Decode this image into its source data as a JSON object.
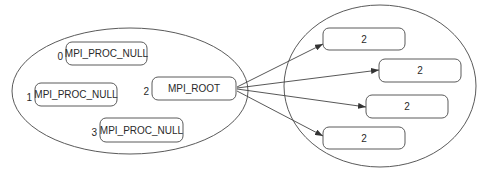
{
  "diagram": {
    "type": "mpi-intercommunicator-broadcast",
    "left_group": {
      "name": "root-group",
      "ellipse": {
        "cx": 130,
        "cy": 91,
        "rx": 118,
        "ry": 63
      },
      "processes": [
        {
          "rank": "0",
          "label": "MPI_PROC_NULL",
          "x": 66,
          "y": 42,
          "w": 81,
          "h": 23
        },
        {
          "rank": "1",
          "label": "MPI_PROC_NULL",
          "x": 35,
          "y": 83,
          "w": 82,
          "h": 23
        },
        {
          "rank": "2",
          "label": "MPI_ROOT",
          "x": 152,
          "y": 77,
          "w": 84,
          "h": 23
        },
        {
          "rank": "3",
          "label": "MPI_PROC_NULL",
          "x": 100,
          "y": 118,
          "w": 83,
          "h": 24
        }
      ]
    },
    "right_group": {
      "name": "receiver-group",
      "ellipse": {
        "cx": 380,
        "cy": 86,
        "rx": 96,
        "ry": 81
      },
      "processes": [
        {
          "label": "2",
          "x": 323,
          "y": 28,
          "w": 82,
          "h": 22
        },
        {
          "label": "2",
          "x": 379,
          "y": 59,
          "w": 82,
          "h": 23
        },
        {
          "label": "2",
          "x": 366,
          "y": 95,
          "w": 82,
          "h": 23
        },
        {
          "label": "2",
          "x": 323,
          "y": 127,
          "w": 82,
          "h": 22
        }
      ]
    },
    "arrows": [
      {
        "from": [
          237,
          87
        ],
        "to": [
          323,
          44
        ]
      },
      {
        "from": [
          237,
          88
        ],
        "to": [
          379,
          70
        ]
      },
      {
        "from": [
          237,
          89
        ],
        "to": [
          366,
          107
        ]
      },
      {
        "from": [
          237,
          91
        ],
        "to": [
          323,
          136
        ]
      }
    ],
    "colors": {
      "stroke": "#5a5a5a",
      "text": "#2a2a2a",
      "background": "#ffffff"
    }
  }
}
